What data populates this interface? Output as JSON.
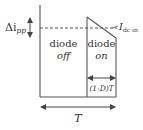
{
  "diagram": {
    "colors": {
      "stroke": "#555555",
      "text": "#333333",
      "background": "#ffffff"
    },
    "labels": {
      "delta_i_main": "Δi",
      "delta_i_sub": "pp",
      "i_dc_main": "I",
      "i_dc_sub": "dc in",
      "region_off_line1": "diode",
      "region_off_line2": "off",
      "region_on_line1": "diode",
      "region_on_line2": "on",
      "on_interval": "(1-D)T",
      "period": "T"
    }
  }
}
